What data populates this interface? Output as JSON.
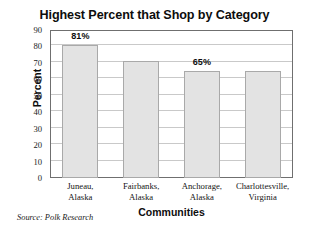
{
  "chart_data": {
    "type": "bar",
    "title": "Highest Percent that Shop by Category",
    "xlabel": "Communities",
    "ylabel": "Percent",
    "categories": [
      "Juneau,\nAlaska",
      "Fairbanks,\nAlaska",
      "Anchorage,\nAlaska",
      "Charlottesville,\nVirginia"
    ],
    "category_lines": [
      [
        "Juneau,",
        "Alaska"
      ],
      [
        "Fairbanks,",
        "Alaska"
      ],
      [
        "Anchorage,",
        "Alaska"
      ],
      [
        "Charlottesville,",
        "Virginia"
      ]
    ],
    "values": [
      81,
      71,
      65,
      65
    ],
    "point_labels": [
      "81%",
      "",
      "65%",
      ""
    ],
    "ylim": [
      0,
      90
    ],
    "ytick_step": 10,
    "yticks": [
      90,
      80,
      70,
      60,
      50,
      40,
      30,
      20,
      10,
      0
    ],
    "ytick_labels": [
      "90",
      "80",
      "70",
      "60",
      "50",
      "40",
      "30",
      "20",
      "10",
      "0"
    ],
    "grid": true,
    "grid_axis": "y",
    "legend": false,
    "legend_position": "none",
    "bar_fill_color": "#e3e3e3",
    "bar_edge_color": "#a9a9a9",
    "frame_color": "#6f6f6f",
    "grid_color": "#c9c9c9",
    "background_color": "#ffffff",
    "text_color": "#0d0d0d"
  },
  "notes": {
    "source": "Source: Polk Research"
  }
}
